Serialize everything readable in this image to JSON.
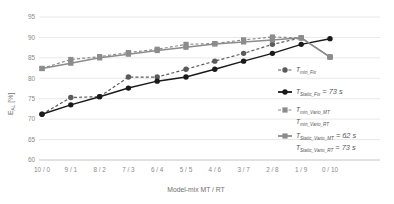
{
  "chart_data": {
    "type": "line",
    "title": "",
    "xlabel": "Model-mix  MT / RT",
    "ylabel": "E_AL [%]",
    "categories": [
      "10 / 0",
      "9 / 1",
      "8 / 2",
      "7 / 3",
      "6 / 4",
      "5 / 5",
      "4 / 6",
      "3 / 7",
      "2 / 8",
      "1 / 9",
      "0 / 10"
    ],
    "ylim": [
      60,
      95
    ],
    "yticks": [
      60,
      65,
      70,
      75,
      80,
      85,
      90,
      95
    ],
    "ytick_labels": [
      "60",
      "65",
      "70",
      "75",
      "80",
      "85",
      "90",
      "95"
    ],
    "grid": true,
    "legend_position": "right",
    "series": [
      {
        "name": "T_min_Fix",
        "label": "T",
        "sub": "min_Fix",
        "value_label": "",
        "style": "dashed",
        "color": "#5a5a5a",
        "marker": "circle",
        "values": [
          71.2,
          75.3,
          75.5,
          80.3,
          80.3,
          82.2,
          84.2,
          86.1,
          88.3,
          89.9,
          85.2
        ]
      },
      {
        "name": "T_Static_Fix",
        "label": "T",
        "sub": "Static_Fix",
        "value_label": "= 73 s",
        "style": "solid",
        "color": "#1a1a1a",
        "marker": "circle",
        "values": [
          71.2,
          73.5,
          75.5,
          77.6,
          79.3,
          80.3,
          82.2,
          84.2,
          86.1,
          88.3,
          89.7
        ]
      },
      {
        "name": "T_min_Vario_MT_RT",
        "label": "T",
        "sub": "min_Vario_MT",
        "label2": "T",
        "sub2": "min_Vario_RT",
        "value_label": "",
        "style": "dashed",
        "color": "#8c8c8c",
        "marker": "square",
        "values": [
          82.4,
          84.6,
          85.3,
          86.3,
          87.1,
          88.3,
          88.5,
          89.4,
          90.1,
          89.9,
          85.2
        ]
      },
      {
        "name": "T_Static_Vario_MT_RT",
        "label": "T",
        "sub": "Static_Vario_MT",
        "value_label": "= 62 s",
        "label2": "T",
        "sub2": "Static_Vario_RT",
        "value_label2": "= 73 s",
        "style": "solid",
        "color": "#8c8c8c",
        "marker": "square",
        "values": [
          82.4,
          83.7,
          85.0,
          85.9,
          86.8,
          87.6,
          88.4,
          88.9,
          89.4,
          89.9,
          85.2
        ]
      }
    ]
  },
  "legend": {
    "entries": [
      {
        "t": "T",
        "sub": "min_Fix",
        "val": ""
      },
      {
        "t": "T",
        "sub": "Static_Fix",
        "val": "= 73 s"
      },
      {
        "t": "T",
        "sub": "min_Vario_MT",
        "val": ""
      },
      {
        "t": "T",
        "sub": "min_Vario_RT",
        "val": ""
      },
      {
        "t": "T",
        "sub": "Static_Vario_MT",
        "val": "= 62 s"
      },
      {
        "t": "T",
        "sub": "Static_Vario_RT",
        "val": "= 73 s"
      }
    ]
  },
  "axes": {
    "y_title_main": "E",
    "y_title_sub": "AL",
    "y_title_unit": " [%]",
    "x_title": "Model-mix  MT / RT"
  }
}
